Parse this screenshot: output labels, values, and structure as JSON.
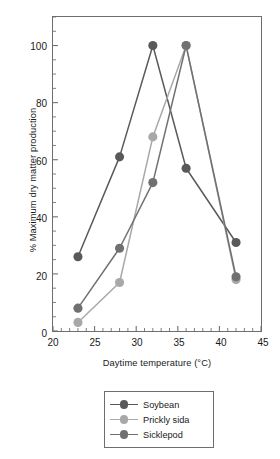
{
  "chart_data": {
    "type": "line",
    "title": "",
    "xlabel": "Daytime temperature (°C)",
    "ylabel": "% Maximum dry matter production",
    "xlim": [
      20,
      45
    ],
    "ylim": [
      0,
      110
    ],
    "xticks": [
      20,
      25,
      30,
      35,
      40,
      45
    ],
    "xtick_labels": [
      "20",
      "25",
      "30",
      "35",
      "40",
      "45"
    ],
    "yticks": [
      0,
      20,
      40,
      60,
      80,
      100
    ],
    "ytick_labels": [
      "0",
      "20",
      "40",
      "60",
      "80",
      "100"
    ],
    "x_minor_tick_step": 1,
    "y_minor_tick_step": 5,
    "grid": false,
    "legend_position": "below-plot",
    "x": [
      23,
      28,
      32,
      36,
      42
    ],
    "series": [
      {
        "name": "Soybean",
        "color": "#595959",
        "values": [
          26,
          61,
          100,
          57,
          31
        ]
      },
      {
        "name": "Prickly sida",
        "color": "#a8a8a8",
        "values": [
          3,
          17,
          68,
          100,
          18
        ]
      },
      {
        "name": "Sicklepod",
        "color": "#707070",
        "values": [
          8,
          29,
          52,
          100,
          19
        ]
      }
    ]
  },
  "legend": {
    "items": [
      {
        "label": "Soybean"
      },
      {
        "label": "Prickly sida"
      },
      {
        "label": "Sicklepod"
      }
    ]
  },
  "colors": {
    "axis": "#6e6e6e",
    "text": "#1a1a1a",
    "background": "#ffffff"
  }
}
